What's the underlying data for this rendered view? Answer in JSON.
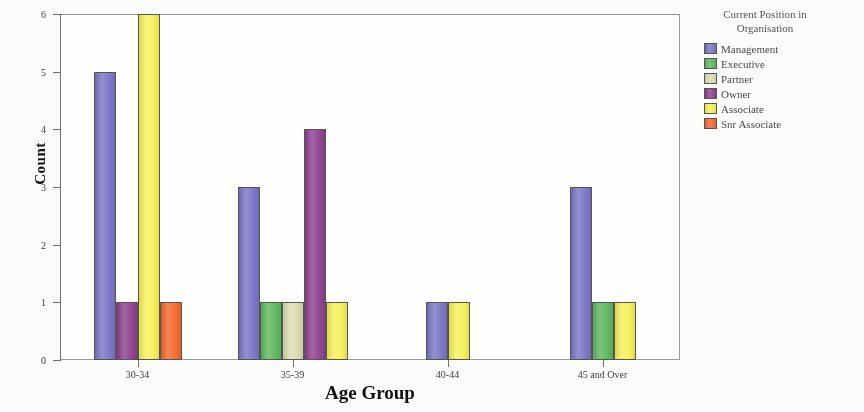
{
  "chart_data": {
    "type": "bar",
    "title": "",
    "xlabel": "Age Group",
    "ylabel": "Count",
    "categories": [
      "30-34",
      "35-39",
      "40-44",
      "45 and Over"
    ],
    "ylim": [
      0,
      6
    ],
    "yticks": [
      0,
      1,
      2,
      3,
      4,
      5,
      6
    ],
    "ytick_labels": [
      "0",
      "1",
      "2",
      "3",
      "4",
      "5",
      "6"
    ],
    "grid": false,
    "legend_position": "right",
    "legend_title": "Current Position in Organisation",
    "series": [
      {
        "name": "Management",
        "color": "#7b74c4",
        "values": [
          5,
          3,
          1,
          3
        ]
      },
      {
        "name": "Executive",
        "color": "#5cb85c",
        "values": [
          0,
          1,
          0,
          1
        ]
      },
      {
        "name": "Partner",
        "color": "#dcdcb0",
        "values": [
          0,
          1,
          0,
          0
        ]
      },
      {
        "name": "Owner",
        "color": "#8e3f8e",
        "values": [
          1,
          4,
          0,
          0
        ]
      },
      {
        "name": "Associate",
        "color": "#f7f05a",
        "values": [
          6,
          1,
          1,
          1
        ]
      },
      {
        "name": "Snr Associate",
        "color": "#f4682a",
        "values": [
          1,
          0,
          0,
          0
        ]
      }
    ]
  },
  "axes": {
    "y_title": "Count",
    "x_title": "Age Group"
  },
  "legend": {
    "title_line1": "Current Position in",
    "title_line2": "Organisation",
    "items": [
      {
        "label": "Management",
        "color": "#7b74c4"
      },
      {
        "label": "Executive",
        "color": "#5cb85c"
      },
      {
        "label": "Partner",
        "color": "#dcdcb0"
      },
      {
        "label": "Owner",
        "color": "#8e3f8e"
      },
      {
        "label": "Associate",
        "color": "#f7f05a"
      },
      {
        "label": "Snr Associate",
        "color": "#f4682a"
      }
    ]
  }
}
